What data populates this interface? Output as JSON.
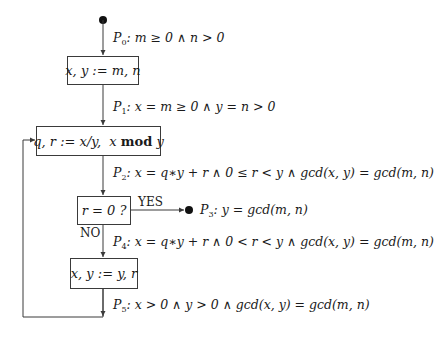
{
  "diagram": {
    "type": "flowchart",
    "start_node": "start-dot",
    "boxes": [
      {
        "id": "init",
        "text": "x, y := m, n"
      },
      {
        "id": "divmod",
        "text_pre": "q, r := x/y,  x ",
        "text_kw": "mod",
        "text_post": " y"
      },
      {
        "id": "test",
        "text": "r = 0 ?"
      },
      {
        "id": "swap",
        "text": "x, y := y, r"
      }
    ],
    "branches": {
      "yes": "YES",
      "no": "NO"
    },
    "assertions": [
      {
        "name": "P",
        "sub": "0",
        "formula": ":  m ≥ 0 ∧ n > 0"
      },
      {
        "name": "P",
        "sub": "1",
        "formula": ":  x = m ≥ 0 ∧ y = n > 0"
      },
      {
        "name": "P",
        "sub": "2",
        "formula": ":  x = q∗y + r ∧ 0 ≤ r < y ∧ gcd(x, y) = gcd(m, n)"
      },
      {
        "name": "P",
        "sub": "3",
        "formula": ":  y = gcd(m, n)"
      },
      {
        "name": "P",
        "sub": "4",
        "formula": ":  x = q∗y + r ∧ 0 < r < y ∧ gcd(x, y) = gcd(m, n)"
      },
      {
        "name": "P",
        "sub": "5",
        "formula": ":  x > 0 ∧ y > 0 ∧ gcd(x, y) = gcd(m, n)"
      }
    ],
    "edges": [
      {
        "from": "start",
        "to": "init",
        "assertion": "P0"
      },
      {
        "from": "init",
        "to": "divmod",
        "assertion": "P1"
      },
      {
        "from": "divmod",
        "to": "test",
        "assertion": "P2"
      },
      {
        "from": "test",
        "to": "end",
        "label": "YES",
        "assertion": "P3"
      },
      {
        "from": "test",
        "to": "swap",
        "label": "NO",
        "assertion": "P4"
      },
      {
        "from": "swap",
        "to": "divmod",
        "assertion": "P5",
        "loop": true
      }
    ],
    "colors": {
      "line": "#3a3a3a",
      "text": "#1a1a1a",
      "background": "#ffffff"
    }
  }
}
